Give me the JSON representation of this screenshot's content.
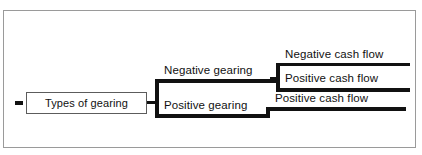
{
  "diagram": {
    "type": "tree-hierarchy",
    "root": {
      "label": "Types of gearing"
    },
    "branches": [
      {
        "label": "Negative gearing",
        "children": [
          {
            "label": "Negative cash flow"
          },
          {
            "label": "Positive cash flow"
          }
        ]
      },
      {
        "label": "Positive gearing",
        "children": [
          {
            "label": "Positive cash flow"
          }
        ]
      }
    ],
    "colors": {
      "line": "#111111",
      "frame": "#9a9a9a",
      "node_border": "#5c5c5c",
      "background": "#ffffff",
      "text": "#111111"
    }
  }
}
